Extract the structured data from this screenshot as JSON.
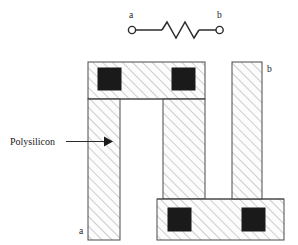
{
  "figure": {
    "background_color": "#ffffff",
    "line_color": "#333333",
    "hatch_color": "#aaaaaa",
    "fill_color": "#fbfbfb",
    "contact_color": "#1a1a1a"
  },
  "schematic": {
    "name": "resistor-symbol",
    "terminal_a_label": "a",
    "terminal_b_label": "b",
    "element": "resistor",
    "zigzag_peaks": 4
  },
  "layout": {
    "name": "polysilicon-serpentine",
    "callout_label": "Polysilicon",
    "terminal_a_label": "a",
    "terminal_b_label": "b",
    "shapes": [
      {
        "name": "top-horizontal-bar",
        "x": 88,
        "y": 62,
        "w": 117,
        "h": 37
      },
      {
        "name": "left-vertical-leg",
        "x": 88,
        "y": 99,
        "w": 32,
        "h": 141
      },
      {
        "name": "middle-vertical-leg",
        "x": 163,
        "y": 99,
        "w": 42,
        "h": 100
      },
      {
        "name": "bottom-horizontal-bar",
        "x": 157,
        "y": 199,
        "w": 127,
        "h": 41
      },
      {
        "name": "right-vertical-leg",
        "x": 232,
        "y": 62,
        "w": 30,
        "h": 137
      }
    ],
    "contacts": [
      {
        "name": "contact-top-left",
        "x": 98,
        "y": 68,
        "w": 23,
        "h": 22
      },
      {
        "name": "contact-top-right",
        "x": 172,
        "y": 68,
        "w": 23,
        "h": 22
      },
      {
        "name": "contact-bottom-left",
        "x": 168,
        "y": 208,
        "w": 23,
        "h": 23
      },
      {
        "name": "contact-bottom-right",
        "x": 242,
        "y": 208,
        "w": 23,
        "h": 23
      }
    ]
  }
}
